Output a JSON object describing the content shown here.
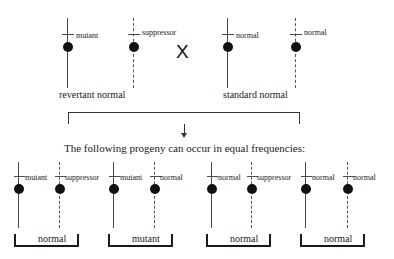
{
  "figure": {
    "caption_middle": "The following progeny can occur in equal frequencies:",
    "cross_symbol": "X"
  },
  "parents": [
    {
      "name": "revertant-normal",
      "label": "revertant normal",
      "chromosomes": [
        {
          "allele": "mutant",
          "style": "solid"
        },
        {
          "allele": "suppressor",
          "style": "dashed"
        }
      ]
    },
    {
      "name": "standard-normal",
      "label": "standard normal",
      "chromosomes": [
        {
          "allele": "normal",
          "style": "solid"
        },
        {
          "allele": "normal",
          "style": "dashed"
        }
      ]
    }
  ],
  "progeny": [
    {
      "name": "progeny-1",
      "phenotype": "normal",
      "chromosomes": [
        {
          "allele": "mutant",
          "style": "solid"
        },
        {
          "allele": "suppressor",
          "style": "dashed"
        }
      ]
    },
    {
      "name": "progeny-2",
      "phenotype": "mutant",
      "chromosomes": [
        {
          "allele": "mutant",
          "style": "solid"
        },
        {
          "allele": "normal",
          "style": "dashed"
        }
      ]
    },
    {
      "name": "progeny-3",
      "phenotype": "normal",
      "chromosomes": [
        {
          "allele": "normal",
          "style": "solid"
        },
        {
          "allele": "suppressor",
          "style": "dashed"
        }
      ]
    },
    {
      "name": "progeny-4",
      "phenotype": "normal",
      "chromosomes": [
        {
          "allele": "normal",
          "style": "solid"
        },
        {
          "allele": "normal",
          "style": "dashed"
        }
      ]
    }
  ],
  "colors": {
    "ink": "#1a1a1a",
    "line": "#4a4a4a",
    "dot": "#111111",
    "bracket": "#333333"
  }
}
